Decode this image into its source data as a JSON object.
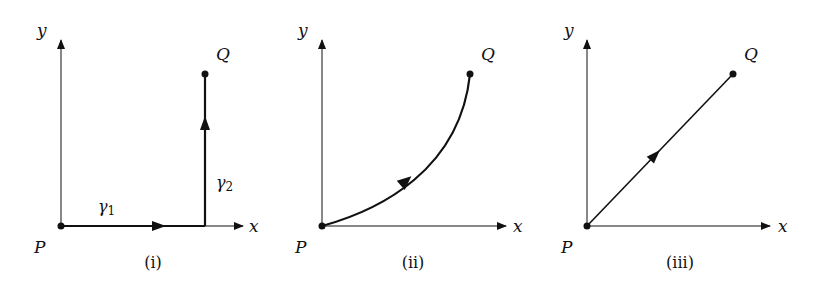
{
  "figure": {
    "panels": [
      {
        "id": "i",
        "caption": "(i)",
        "axes": {
          "x_label": "x",
          "y_label": "y"
        },
        "points": {
          "start": "P",
          "end": "Q"
        },
        "path_type": "two straight segments: horizontal along x-axis then vertical",
        "segments": [
          {
            "label": "γ",
            "subscript": "1",
            "direction": "right"
          },
          {
            "label": "γ",
            "subscript": "2",
            "direction": "up"
          }
        ]
      },
      {
        "id": "ii",
        "caption": "(ii)",
        "axes": {
          "x_label": "x",
          "y_label": "y"
        },
        "points": {
          "start": "P",
          "end": "Q"
        },
        "path_type": "convex curve from P to Q"
      },
      {
        "id": "iii",
        "caption": "(iii)",
        "axes": {
          "x_label": "x",
          "y_label": "y"
        },
        "points": {
          "start": "P",
          "end": "Q"
        },
        "path_type": "straight line from P to Q"
      }
    ],
    "colors": {
      "ink": "#111111",
      "background": "#ffffff"
    }
  }
}
